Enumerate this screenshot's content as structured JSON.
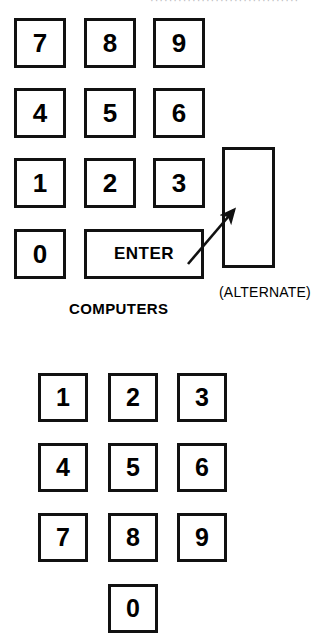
{
  "figure": {
    "top_cropped_text": "································",
    "arrow": {
      "name": "pointer-arrow",
      "from_x": 188,
      "from_y": 264,
      "to_x": 238,
      "to_y": 206,
      "color": "#111111"
    },
    "colors": {
      "key_border": "#111111",
      "key_fill": "#ffffff",
      "text": "#000000",
      "background": "#ffffff"
    }
  },
  "computer_keypad": {
    "caption": "COMPUTERS",
    "alternate_caption": "(ALTERNATE)",
    "enter_label": "ENTER",
    "rows": [
      {
        "keys": [
          "7",
          "8",
          "9"
        ]
      },
      {
        "keys": [
          "4",
          "5",
          "6"
        ]
      },
      {
        "keys": [
          "1",
          "2",
          "3"
        ]
      }
    ],
    "zero_key": "0",
    "keys": [
      {
        "label": "7",
        "x": 14,
        "y": 18
      },
      {
        "label": "8",
        "x": 84,
        "y": 18
      },
      {
        "label": "9",
        "x": 153,
        "y": 18
      },
      {
        "label": "4",
        "x": 14,
        "y": 88
      },
      {
        "label": "5",
        "x": 84,
        "y": 88
      },
      {
        "label": "6",
        "x": 153,
        "y": 88
      },
      {
        "label": "1",
        "x": 14,
        "y": 158
      },
      {
        "label": "2",
        "x": 84,
        "y": 158
      },
      {
        "label": "3",
        "x": 153,
        "y": 158
      },
      {
        "label": "0",
        "x": 14,
        "y": 229
      }
    ],
    "enter_key": {
      "x": 84,
      "y": 229,
      "w": 120,
      "h": 50
    },
    "alternate_key": {
      "x": 222,
      "y": 147,
      "w": 53,
      "h": 121
    },
    "caption_pos": {
      "x": 69,
      "y": 300
    },
    "alternate_caption_pos": {
      "x": 219,
      "y": 284
    }
  },
  "phone_keypad": {
    "rows": [
      {
        "keys": [
          "1",
          "2",
          "3"
        ]
      },
      {
        "keys": [
          "4",
          "5",
          "6"
        ]
      },
      {
        "keys": [
          "7",
          "8",
          "9"
        ]
      }
    ],
    "zero_key": "0",
    "keys": [
      {
        "label": "1",
        "x": 38,
        "y": 373
      },
      {
        "label": "2",
        "x": 108,
        "y": 373
      },
      {
        "label": "3",
        "x": 177,
        "y": 373
      },
      {
        "label": "4",
        "x": 38,
        "y": 443
      },
      {
        "label": "5",
        "x": 108,
        "y": 443
      },
      {
        "label": "6",
        "x": 177,
        "y": 443
      },
      {
        "label": "7",
        "x": 38,
        "y": 513
      },
      {
        "label": "8",
        "x": 108,
        "y": 513
      },
      {
        "label": "9",
        "x": 177,
        "y": 513
      },
      {
        "label": "0",
        "x": 108,
        "y": 584
      }
    ]
  }
}
